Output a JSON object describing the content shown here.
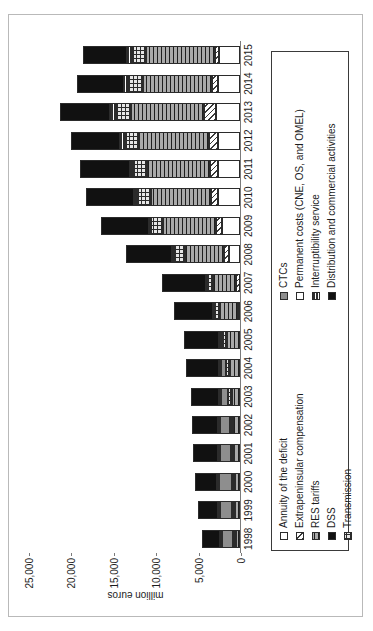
{
  "chart_data": {
    "type": "bar",
    "subtype": "stacked-bar",
    "title": "",
    "xlabel": "",
    "ylabel": "million euros",
    "ylim": [
      0,
      25000
    ],
    "yticks": [
      "0",
      "5,000",
      "10,000",
      "15,000",
      "20,000",
      "25,000"
    ],
    "ytick_values": [
      0,
      5000,
      10000,
      15000,
      20000,
      25000
    ],
    "grid": false,
    "legend_position": "below-plot",
    "orientation": "page-rotated-90-ccw",
    "categories": [
      "1998",
      "1999",
      "2000",
      "2001",
      "2002",
      "2003",
      "2004",
      "2005",
      "2006",
      "2007",
      "2008",
      "2009",
      "2010",
      "2011",
      "2012",
      "2013",
      "2014",
      "2015"
    ],
    "series": [
      {
        "name": "Annuity of the deficit",
        "pattern": "p-annuity",
        "values": [
          0,
          0,
          0,
          0,
          0,
          0,
          0,
          0,
          0,
          0,
          1300,
          2100,
          2550,
          2600,
          2650,
          2800,
          2650,
          2500
        ]
      },
      {
        "name": "Extrapeninsular compensation",
        "pattern": "p-extrapen",
        "values": [
          0,
          0,
          0,
          0,
          0,
          0,
          0,
          0,
          280,
          420,
          620,
          700,
          850,
          900,
          1050,
          1500,
          600,
          500
        ]
      },
      {
        "name": "RES tariffs",
        "pattern": "p-res",
        "values": [
          480,
          560,
          620,
          700,
          820,
          950,
          1180,
          1500,
          2100,
          2750,
          4600,
          6300,
          7100,
          7500,
          8200,
          8600,
          8200,
          8100
        ]
      },
      {
        "name": "DSS",
        "pattern": "p-dss",
        "values": [
          0,
          0,
          0,
          0,
          0,
          0,
          0,
          0,
          0,
          0,
          0,
          0,
          0,
          0,
          0,
          0,
          0,
          0
        ]
      },
      {
        "name": "Transmission",
        "pattern": "p-transmission",
        "values": [
          320,
          340,
          360,
          380,
          400,
          420,
          450,
          480,
          520,
          560,
          1250,
          1400,
          1500,
          1550,
          1600,
          1650,
          1600,
          1580
        ]
      },
      {
        "name": "CTCs",
        "pattern": "p-ctcs",
        "values": [
          1350,
          1500,
          1450,
          1300,
          1150,
          900,
          650,
          300,
          0,
          0,
          0,
          0,
          0,
          0,
          0,
          0,
          0,
          0
        ]
      },
      {
        "name": "Permanent costs (CNE, OS, and OMEL)",
        "pattern": "p-permanent",
        "values": [
          60,
          60,
          70,
          70,
          80,
          80,
          90,
          90,
          100,
          110,
          120,
          130,
          140,
          150,
          150,
          160,
          150,
          150
        ]
      },
      {
        "name": "Interruptibility service",
        "pattern": "p-interrupt",
        "values": [
          0,
          0,
          0,
          0,
          0,
          0,
          0,
          0,
          0,
          0,
          0,
          0,
          180,
          200,
          450,
          600,
          450,
          430
        ]
      },
      {
        "name": "Distribution and commercial activities",
        "pattern": "p-distrib",
        "values": [
          2100,
          2350,
          2600,
          2900,
          3050,
          3300,
          3800,
          4100,
          4600,
          5200,
          5500,
          5700,
          5750,
          5800,
          5800,
          5900,
          5500,
          5200
        ]
      }
    ],
    "totals": [
      4310,
      4810,
      5100,
      5350,
      5500,
      5650,
      6170,
      6470,
      7600,
      9040,
      13390,
      16330,
      18070,
      18700,
      19900,
      21210,
      19150,
      18460
    ]
  },
  "legend": {
    "column_a": [
      {
        "label": "Annuity of the deficit",
        "pattern": "p-annuity"
      },
      {
        "label": "Extrapeninsular compensation",
        "pattern": "p-extrapen"
      },
      {
        "label": "RES tariffs",
        "pattern": "p-res"
      },
      {
        "label": "DSS",
        "pattern": "p-dss"
      },
      {
        "label": "Transmission",
        "pattern": "p-transmission"
      }
    ],
    "column_b": [
      {
        "label": "CTCs",
        "pattern": "p-ctcs"
      },
      {
        "label": "Permanent costs (CNE, OS, and OMEL)",
        "pattern": "p-permanent"
      },
      {
        "label": "Interruptibility service",
        "pattern": "p-interrupt"
      },
      {
        "label": "Distribution and commercial activities",
        "pattern": "p-distrib"
      }
    ]
  }
}
